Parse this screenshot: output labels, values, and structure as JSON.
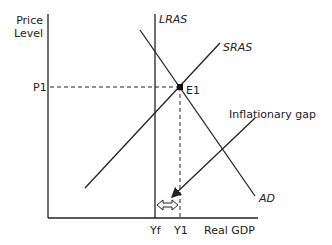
{
  "diagram": {
    "axes": {
      "y_label_line1": "Price",
      "y_label_line2": "Level",
      "x_label": "Real GDP"
    },
    "curves": {
      "lras": "LRAS",
      "sras": "SRAS",
      "ad": "AD"
    },
    "points": {
      "equilibrium": "E1",
      "price": "P1",
      "output_full": "Yf",
      "output_actual": "Y1"
    },
    "annotation": "Inflationary gap",
    "colors": {
      "line": "#222222",
      "background": "#ffffff"
    }
  }
}
